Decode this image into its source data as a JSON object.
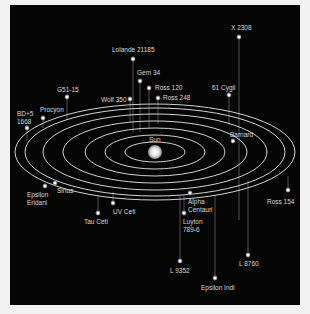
{
  "colors": {
    "background": "#050505",
    "frame": "#f2f2f2",
    "orbit": "#e8e8e8",
    "star": "#ffffff",
    "label": "#d8d8d8"
  },
  "sun": {
    "label": "Sun",
    "x": 155,
    "y": 152
  },
  "orbits": [
    {
      "rx": 30,
      "ry": 10
    },
    {
      "rx": 50,
      "ry": 17
    },
    {
      "rx": 70,
      "ry": 24
    },
    {
      "rx": 92,
      "ry": 31
    },
    {
      "rx": 112,
      "ry": 38
    },
    {
      "rx": 130,
      "ry": 44
    },
    {
      "rx": 140,
      "ry": 48
    }
  ],
  "stars": [
    {
      "name": "Lolande 21185",
      "x": 133,
      "y": 59,
      "lx": 112,
      "ly": 46,
      "drop": 133
    },
    {
      "name": "Gem 34",
      "x": 140,
      "y": 81,
      "lx": 137,
      "ly": 69,
      "drop": 132
    },
    {
      "name": "Ross 120",
      "x": 149,
      "y": 88,
      "lx": 155,
      "ly": 84,
      "drop": 128
    },
    {
      "name": "Ross 248",
      "x": 158,
      "y": 98,
      "lx": 163,
      "ly": 94,
      "drop": 124
    },
    {
      "name": "Wolf 350",
      "x": 130,
      "y": 99,
      "lx": 101,
      "ly": 96,
      "drop": 122
    },
    {
      "name": "G51-15",
      "x": 67,
      "y": 97,
      "lx": 57,
      "ly": 86,
      "drop": 120
    },
    {
      "name": "Procyon",
      "x": 43,
      "y": 118,
      "lx": 40,
      "ly": 106,
      "drop": 128
    },
    {
      "name": "BD+5\n1668",
      "x": 27,
      "y": 128,
      "lx": 17,
      "ly": 110,
      "drop": 140
    },
    {
      "name": "X 2308",
      "x": 239,
      "y": 37,
      "lx": 231,
      "ly": 24,
      "drop": 220
    },
    {
      "name": "61 Cygil",
      "x": 229,
      "y": 95,
      "lx": 212,
      "ly": 84,
      "drop": 125
    },
    {
      "name": "Barnard",
      "x": 233,
      "y": 141,
      "lx": 230,
      "ly": 131,
      "drop": 141
    },
    {
      "name": "Epsilon\nEridani",
      "x": 45,
      "y": 186,
      "lx": 27,
      "ly": 191,
      "drop": 186
    },
    {
      "name": "Sirius",
      "x": 55,
      "y": 183,
      "lx": 57,
      "ly": 187,
      "drop": 183
    },
    {
      "name": "UV Ceti",
      "x": 113,
      "y": 203,
      "lx": 113,
      "ly": 208,
      "drop": 192
    },
    {
      "name": "Tau Ceti",
      "x": 98,
      "y": 213,
      "lx": 84,
      "ly": 218,
      "drop": 196
    },
    {
      "name": "Alpha\nCentauri",
      "x": 190,
      "y": 193,
      "lx": 188,
      "ly": 198,
      "drop": 193
    },
    {
      "name": "Luyton\n789-6",
      "x": 184,
      "y": 213,
      "lx": 183,
      "ly": 218,
      "drop": 196
    },
    {
      "name": "Ross 154",
      "x": 288,
      "y": 190,
      "lx": 267,
      "ly": 198,
      "drop": 176
    },
    {
      "name": "L 9352",
      "x": 180,
      "y": 261,
      "lx": 170,
      "ly": 267,
      "drop": 196
    },
    {
      "name": "L 8760",
      "x": 248,
      "y": 255,
      "lx": 239,
      "ly": 260,
      "drop": 180
    },
    {
      "name": "Epsilon Indi",
      "x": 215,
      "y": 278,
      "lx": 201,
      "ly": 284,
      "drop": 195
    }
  ]
}
